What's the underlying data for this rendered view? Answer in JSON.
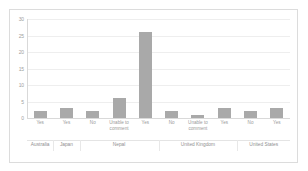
{
  "chart_data": {
    "type": "bar",
    "title": "",
    "subtitle": "",
    "xlabel": "",
    "ylabel": "",
    "ylim": [
      0,
      30
    ],
    "yticks": [
      0,
      5,
      10,
      15,
      20,
      25,
      30
    ],
    "ytick_labels": [
      "0",
      "5",
      "10",
      "15",
      "20",
      "25",
      "30"
    ],
    "grid": true,
    "grid_axis": "y",
    "legend": false,
    "legend_position": "none",
    "orientation": "vertical",
    "bar_color": "#a9a9a9",
    "background_color": "#ffffff",
    "border_color": "#dcdcdc",
    "axis_color": "#d9d9d9",
    "gridline_color": "#eeeeee",
    "tick_label_color": "#a0a0a0",
    "categories": [
      "Yes",
      "Yes",
      "No",
      "Unable to comment",
      "Yes",
      "No",
      "Unable to comment",
      "Yes",
      "No",
      "Yes"
    ],
    "values": [
      2,
      3,
      2,
      6,
      26,
      2,
      1,
      3,
      2,
      3
    ],
    "groups": [
      {
        "label": "Australia",
        "categories": [
          "Yes"
        ],
        "values": [
          2
        ]
      },
      {
        "label": "Japan",
        "categories": [
          "Yes"
        ],
        "values": [
          3
        ]
      },
      {
        "label": "Nepal",
        "categories": [
          "No",
          "Unable to comment",
          "Yes"
        ],
        "values": [
          2,
          6,
          26
        ]
      },
      {
        "label": "United Kingdom",
        "categories": [
          "No",
          "Unable to comment",
          "Yes"
        ],
        "values": [
          2,
          1,
          3
        ]
      },
      {
        "label": "United States",
        "categories": [
          "No",
          "Yes"
        ],
        "values": [
          2,
          3
        ]
      }
    ]
  }
}
